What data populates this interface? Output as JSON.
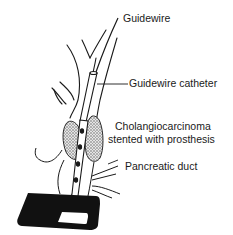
{
  "diagram": {
    "labels": {
      "guidewire": "Guidewire",
      "guidewire_catheter": "Guidewire catheter",
      "tumor_line1": "Cholangiocarcinoma",
      "tumor_line2": "stented with prosthesis",
      "pancreatic_duct": "Pancreatic duct"
    },
    "colors": {
      "ink": "#1a1a1a",
      "background": "#ffffff",
      "tumor_fill": "#bdbdbd"
    }
  }
}
